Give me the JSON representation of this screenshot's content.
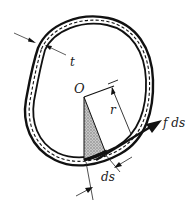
{
  "diagram": {
    "type": "thin-walled closed tube cross-section",
    "labels": {
      "thickness": "t",
      "origin": "O",
      "radius": "r",
      "force": "f ds",
      "element_length": "ds"
    },
    "elements": [
      {
        "id": "tube-wall",
        "description": "closed thin-walled tube with outer and inner boundary"
      },
      {
        "id": "centerline",
        "description": "dashed median line of wall"
      },
      {
        "id": "thickness-dimension",
        "label": "t"
      },
      {
        "id": "origin-point",
        "label": "O"
      },
      {
        "id": "radius-dimension",
        "label": "r"
      },
      {
        "id": "shaded-triangle",
        "description": "shaded area from O to element ds"
      },
      {
        "id": "force-arrow",
        "label": "f ds"
      },
      {
        "id": "ds-dimension",
        "label": "ds"
      }
    ],
    "colors": {
      "line": "#111111",
      "shade": "#9a9a9a",
      "background": "#ffffff"
    }
  }
}
